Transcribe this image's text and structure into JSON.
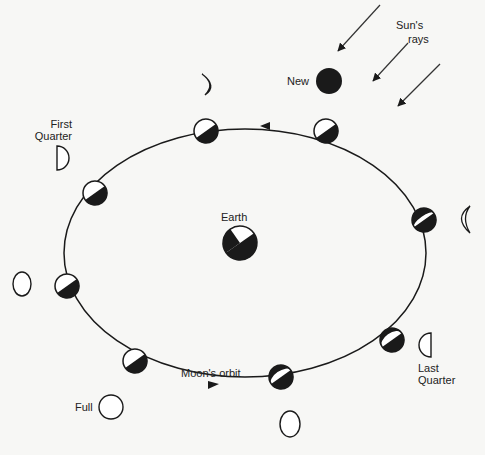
{
  "labels": {
    "sun": "Sun's",
    "rays": "rays",
    "new": "New",
    "first": "First",
    "quarter": "Quarter",
    "earth": "Earth",
    "orbit": "Moon's orbit",
    "full": "Full",
    "last": "Last",
    "last_quarter": "Quarter"
  },
  "colors": {
    "ink": "#1a1a1a",
    "background": "#f7f7f5"
  },
  "orbit": {
    "cx": 245,
    "cy": 253,
    "rx": 185,
    "ry": 125
  },
  "orbit_moons": [
    {
      "x": 326,
      "y": 131
    },
    {
      "x": 206,
      "y": 131
    },
    {
      "x": 95,
      "y": 193
    },
    {
      "x": 67,
      "y": 286
    },
    {
      "x": 135,
      "y": 361
    },
    {
      "x": 281,
      "y": 377
    },
    {
      "x": 392,
      "y": 340
    },
    {
      "x": 424,
      "y": 220
    }
  ],
  "phases": [
    "new",
    "waxing-crescent",
    "first-quarter",
    "waxing-gibbous",
    "full",
    "waning-gibbous",
    "last-quarter",
    "waning-crescent"
  ]
}
